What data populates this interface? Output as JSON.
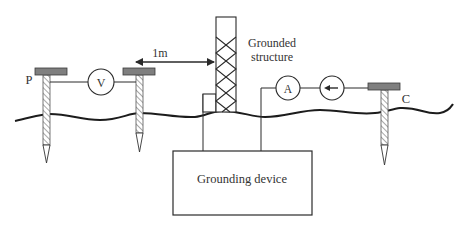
{
  "diagram": {
    "colors": {
      "line": "#2a2a2a",
      "electrode_cap": "#7f7f7f",
      "electrode_shaft_hatch": "#b0b0b0",
      "background": "#ffffff",
      "text": "#333333"
    },
    "labels": {
      "p_electrode": "P",
      "c_electrode": "C",
      "voltmeter": "V",
      "ammeter": "A",
      "distance": "1m",
      "structure_line1": "Grounded",
      "structure_line2": "structure",
      "grounding_device": "Grounding device"
    },
    "components": [
      {
        "id": "electrode-p",
        "type": "electrode",
        "label": "P"
      },
      {
        "id": "electrode-mid",
        "type": "electrode",
        "label": ""
      },
      {
        "id": "voltmeter",
        "type": "meter",
        "symbol": "V"
      },
      {
        "id": "grounded-structure",
        "type": "lattice-tower"
      },
      {
        "id": "distance-arrow",
        "type": "dimension",
        "value": "1m"
      },
      {
        "id": "ammeter",
        "type": "meter",
        "symbol": "A"
      },
      {
        "id": "current-source",
        "type": "source",
        "symbol": "left-arrow"
      },
      {
        "id": "electrode-c",
        "type": "electrode",
        "label": "C"
      },
      {
        "id": "grounding-device",
        "type": "box",
        "label": "Grounding device"
      },
      {
        "id": "ground-surface",
        "type": "wavy-line"
      }
    ]
  }
}
